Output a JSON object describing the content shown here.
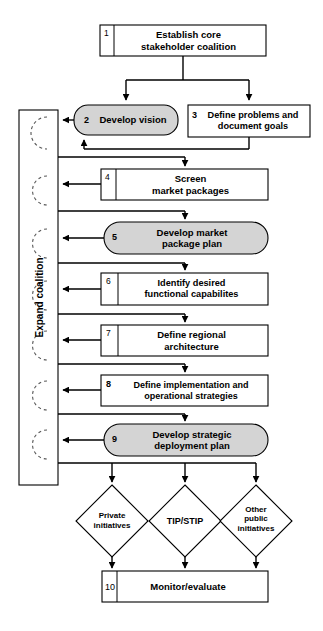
{
  "diagram": {
    "colors": {
      "stroke": "#000000",
      "fill_plain": "#ffffff",
      "fill_shaded": "#d4d4d4",
      "dashed": "#555555"
    },
    "loop_label": "Expand coalition",
    "nodes": [
      {
        "id": "n1",
        "number": "1",
        "label": "Establish core\nstakeholder coalition",
        "shape": "rect",
        "shaded": false
      },
      {
        "id": "n2",
        "number": "2",
        "label": "Develop vision",
        "shape": "rounded",
        "shaded": true
      },
      {
        "id": "n3",
        "number": "3",
        "label": "Define problems and\ndocument goals",
        "shape": "rect",
        "shaded": false
      },
      {
        "id": "n4",
        "number": "4",
        "label": "Screen\nmarket packages",
        "shape": "rect",
        "shaded": false
      },
      {
        "id": "n5",
        "number": "5",
        "label": "Develop market\npackage plan",
        "shape": "rounded",
        "shaded": true
      },
      {
        "id": "n6",
        "number": "6",
        "label": "Identify desired\nfunctional capabilites",
        "shape": "rect",
        "shaded": false
      },
      {
        "id": "n7",
        "number": "7",
        "label": "Define regional\narchitecture",
        "shape": "rect",
        "shaded": false
      },
      {
        "id": "n8",
        "number": "8",
        "label": "Define implementation and\noperational strategies",
        "shape": "rect",
        "shaded": false
      },
      {
        "id": "n9",
        "number": "9",
        "label": "Develop strategic\ndeployment plan",
        "shape": "rounded",
        "shaded": true
      },
      {
        "id": "n10",
        "number": "10",
        "label": "Monitor/evaluate",
        "shape": "rect",
        "shaded": false
      }
    ],
    "decisions": [
      {
        "id": "d1",
        "label": "Private\ninitiatives"
      },
      {
        "id": "d2",
        "label": "TIP/STIP"
      },
      {
        "id": "d3",
        "label": "Other\npublic\ninitiatives"
      }
    ]
  }
}
